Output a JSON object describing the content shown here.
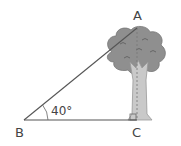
{
  "diagram": {
    "vertices": [
      {
        "label": "A",
        "x": 137,
        "y": 28
      },
      {
        "label": "B",
        "x": 24,
        "y": 120
      },
      {
        "label": "C",
        "x": 136,
        "y": 120
      }
    ],
    "angle_label": "40°",
    "angle_at": "B",
    "right_angle_at": "C",
    "colors": {
      "line": "#555555",
      "crown": "#8f8f8f",
      "crown_detail": "#6a6a6a",
      "trunk": "#c9c9c9",
      "text": "#444444"
    }
  }
}
